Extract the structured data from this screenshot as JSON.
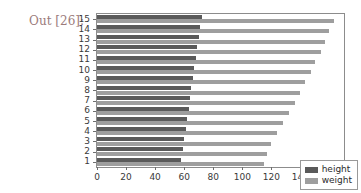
{
  "notebook": {
    "out_prompt": "Out [26]:"
  },
  "legend": {
    "position": "lower-right",
    "entries": [
      {
        "label": "height",
        "color": "#5a5a5a",
        "icon": "legend-swatch-icon"
      },
      {
        "label": "weight",
        "color": "#9e9e9e",
        "icon": "legend-swatch-icon"
      }
    ]
  },
  "chart_data": {
    "type": "bar",
    "orientation": "horizontal",
    "title": "",
    "xlabel": "",
    "ylabel": "",
    "xlim": [
      0,
      170
    ],
    "ylim": [
      0.4,
      15.6
    ],
    "grid": false,
    "xticks": [
      0,
      20,
      40,
      60,
      80,
      100,
      120,
      140,
      160
    ],
    "xtick_labels": [
      "0",
      "20",
      "40",
      "60",
      "80",
      "100",
      "120",
      "140",
      "160"
    ],
    "categories": [
      1,
      2,
      3,
      4,
      5,
      6,
      7,
      8,
      9,
      10,
      11,
      12,
      13,
      14,
      15
    ],
    "ytick_labels": [
      "1",
      "2",
      "3",
      "4",
      "5",
      "6",
      "7",
      "8",
      "9",
      "10",
      "11",
      "12",
      "13",
      "14",
      "15"
    ],
    "series": [
      {
        "name": "height",
        "color": "#5a5a5a",
        "values": [
          58,
          59,
          60,
          61,
          62,
          63,
          64,
          65,
          66,
          67,
          68,
          69,
          70,
          71,
          72
        ]
      },
      {
        "name": "weight",
        "color": "#9e9e9e",
        "values": [
          115,
          117,
          120,
          124,
          128,
          132,
          136,
          140,
          143,
          147,
          150,
          154,
          157,
          160,
          163
        ]
      }
    ]
  }
}
